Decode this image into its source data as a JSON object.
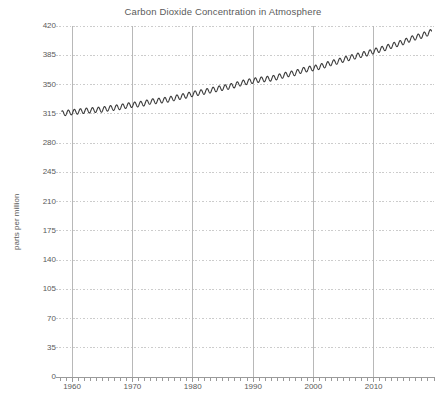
{
  "chart_data": {
    "type": "line",
    "title": "Carbon Dioxide Concentration in Atmosphere",
    "xlabel": "",
    "ylabel": "parts per million",
    "xlim": [
      1958,
      2020
    ],
    "ylim": [
      0,
      420
    ],
    "grid": true,
    "legend": null,
    "y_ticks": [
      0,
      35,
      70,
      105,
      140,
      175,
      210,
      245,
      280,
      315,
      350,
      385,
      420
    ],
    "x_ticks": [
      1960,
      1970,
      1980,
      1990,
      2000,
      2010
    ],
    "x_minor_tick_step": 1,
    "line_color": "#3a3a3a",
    "grid_color": "#cccccc",
    "series": [
      {
        "name": "CO2 concentration (monthly mean, Mauna Loa)",
        "x": [
          1958.5,
          1959.0,
          1959.5,
          1960.0,
          1960.5,
          1961.0,
          1961.5,
          1962.0,
          1962.5,
          1963.0,
          1963.5,
          1964.0,
          1964.5,
          1965.0,
          1965.5,
          1966.0,
          1966.5,
          1967.0,
          1967.5,
          1968.0,
          1968.5,
          1969.0,
          1969.5,
          1970.0,
          1970.5,
          1971.0,
          1971.5,
          1972.0,
          1972.5,
          1973.0,
          1973.5,
          1974.0,
          1974.5,
          1975.0,
          1975.5,
          1976.0,
          1976.5,
          1977.0,
          1977.5,
          1978.0,
          1978.5,
          1979.0,
          1979.5,
          1980.0,
          1980.5,
          1981.0,
          1981.5,
          1982.0,
          1982.5,
          1983.0,
          1983.5,
          1984.0,
          1984.5,
          1985.0,
          1985.5,
          1986.0,
          1986.5,
          1987.0,
          1987.5,
          1988.0,
          1988.5,
          1989.0,
          1989.5,
          1990.0,
          1990.5,
          1991.0,
          1991.5,
          1992.0,
          1992.5,
          1993.0,
          1993.5,
          1994.0,
          1994.5,
          1995.0,
          1995.5,
          1996.0,
          1996.5,
          1997.0,
          1997.5,
          1998.0,
          1998.5,
          1999.0,
          1999.5,
          2000.0,
          2000.5,
          2001.0,
          2001.5,
          2002.0,
          2002.5,
          2003.0,
          2003.5,
          2004.0,
          2004.5,
          2005.0,
          2005.5,
          2006.0,
          2006.5,
          2007.0,
          2007.5,
          2008.0,
          2008.5,
          2009.0,
          2009.5,
          2010.0,
          2010.5,
          2011.0,
          2011.5,
          2012.0,
          2012.5,
          2013.0,
          2013.5,
          2014.0,
          2014.5,
          2015.0,
          2015.5,
          2016.0,
          2016.5,
          2017.0,
          2017.5,
          2018.0,
          2018.5,
          2019.0,
          2019.5
        ],
        "annual_means": [
          {
            "year": 1959,
            "value": 315.97
          },
          {
            "year": 1960,
            "value": 316.91
          },
          {
            "year": 1961,
            "value": 317.64
          },
          {
            "year": 1962,
            "value": 318.45
          },
          {
            "year": 1963,
            "value": 318.99
          },
          {
            "year": 1964,
            "value": 319.62
          },
          {
            "year": 1965,
            "value": 320.04
          },
          {
            "year": 1966,
            "value": 321.38
          },
          {
            "year": 1967,
            "value": 322.16
          },
          {
            "year": 1968,
            "value": 323.04
          },
          {
            "year": 1969,
            "value": 324.62
          },
          {
            "year": 1970,
            "value": 325.68
          },
          {
            "year": 1971,
            "value": 326.32
          },
          {
            "year": 1972,
            "value": 327.45
          },
          {
            "year": 1973,
            "value": 329.68
          },
          {
            "year": 1974,
            "value": 330.18
          },
          {
            "year": 1975,
            "value": 331.11
          },
          {
            "year": 1976,
            "value": 332.04
          },
          {
            "year": 1977,
            "value": 333.83
          },
          {
            "year": 1978,
            "value": 335.4
          },
          {
            "year": 1979,
            "value": 336.84
          },
          {
            "year": 1980,
            "value": 338.75
          },
          {
            "year": 1981,
            "value": 340.11
          },
          {
            "year": 1982,
            "value": 341.45
          },
          {
            "year": 1983,
            "value": 343.05
          },
          {
            "year": 1984,
            "value": 344.65
          },
          {
            "year": 1985,
            "value": 346.12
          },
          {
            "year": 1986,
            "value": 347.42
          },
          {
            "year": 1987,
            "value": 349.19
          },
          {
            "year": 1988,
            "value": 351.57
          },
          {
            "year": 1989,
            "value": 353.12
          },
          {
            "year": 1990,
            "value": 354.39
          },
          {
            "year": 1991,
            "value": 355.61
          },
          {
            "year": 1992,
            "value": 356.45
          },
          {
            "year": 1993,
            "value": 357.1
          },
          {
            "year": 1994,
            "value": 358.83
          },
          {
            "year": 1995,
            "value": 360.82
          },
          {
            "year": 1996,
            "value": 362.61
          },
          {
            "year": 1997,
            "value": 363.73
          },
          {
            "year": 1998,
            "value": 366.7
          },
          {
            "year": 1999,
            "value": 368.38
          },
          {
            "year": 2000,
            "value": 369.55
          },
          {
            "year": 2001,
            "value": 371.14
          },
          {
            "year": 2002,
            "value": 373.28
          },
          {
            "year": 2003,
            "value": 375.8
          },
          {
            "year": 2004,
            "value": 377.52
          },
          {
            "year": 2005,
            "value": 379.8
          },
          {
            "year": 2006,
            "value": 381.9
          },
          {
            "year": 2007,
            "value": 383.79
          },
          {
            "year": 2008,
            "value": 385.6
          },
          {
            "year": 2009,
            "value": 387.43
          },
          {
            "year": 2010,
            "value": 389.9
          },
          {
            "year": 2011,
            "value": 391.65
          },
          {
            "year": 2012,
            "value": 393.85
          },
          {
            "year": 2013,
            "value": 396.52
          },
          {
            "year": 2014,
            "value": 398.65
          },
          {
            "year": 2015,
            "value": 400.83
          },
          {
            "year": 2016,
            "value": 404.24
          },
          {
            "year": 2017,
            "value": 406.55
          },
          {
            "year": 2018,
            "value": 408.52
          },
          {
            "year": 2019,
            "value": 411.44
          }
        ],
        "seasonal_amplitude": 6.2
      }
    ]
  },
  "axes": {
    "y_tick_labels": [
      "420",
      "385",
      "350",
      "315",
      "280",
      "245",
      "210",
      "175",
      "140",
      "105",
      "70",
      "35",
      "0"
    ],
    "x_tick_labels": [
      "1960",
      "1970",
      "1980",
      "1990",
      "2000",
      "2010"
    ]
  }
}
